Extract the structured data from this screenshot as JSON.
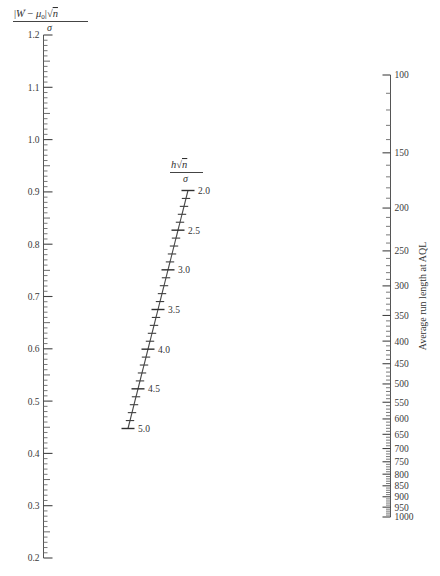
{
  "chart_data": {
    "type": "line",
    "title": "",
    "subtitle": "",
    "chart_kind": "nomogram",
    "left_axis": {
      "label_parts": {
        "numerator": "|W̅ − μ₀|√n",
        "numerator_w": "W",
        "numerator_mu": "μ",
        "numerator_mu_sub": "0",
        "numerator_sqrt": "n",
        "denominator": "σ"
      },
      "label_plain": "|W̅ − μ₀|√n / σ",
      "ticks": [
        "1.2",
        "1.1",
        "1.0",
        "0.9",
        "0.8",
        "0.7",
        "0.6",
        "0.5",
        "0.4",
        "0.3",
        "0.2"
      ],
      "values": [
        1.2,
        1.1,
        1.0,
        0.9,
        0.8,
        0.7,
        0.6,
        0.5,
        0.4,
        0.3,
        0.2
      ],
      "range": [
        0.2,
        1.2
      ],
      "minor_step": 0.01,
      "mid_step": 0.05,
      "major_step": 0.1,
      "scale": "linear",
      "orientation": "vertical-descending"
    },
    "middle_axis": {
      "label_parts": {
        "numerator_h": "h",
        "numerator_sqrt": "n",
        "denominator": "σ"
      },
      "label_plain": "h√n / σ",
      "ticks": [
        "2.0",
        "2.5",
        "3.0",
        "3.5",
        "4.0",
        "4.5",
        "5.0"
      ],
      "values": [
        2.0,
        2.5,
        3.0,
        3.5,
        4.0,
        4.5,
        5.0
      ],
      "range": [
        2.0,
        5.0
      ],
      "minor_step": 0.1,
      "major_step": 0.5,
      "scale": "linear",
      "orientation": "diagonal"
    },
    "right_axis": {
      "label": "Average run length at AQL",
      "ticks": [
        "100",
        "150",
        "200",
        "250",
        "300",
        "350",
        "400",
        "450",
        "500",
        "550",
        "600",
        "650",
        "700",
        "750",
        "800",
        "850",
        "900",
        "950",
        "1000"
      ],
      "values": [
        100,
        150,
        200,
        250,
        300,
        350,
        400,
        450,
        500,
        550,
        600,
        650,
        700,
        750,
        800,
        850,
        900,
        950,
        1000
      ],
      "range": [
        100,
        1000
      ],
      "scale": "logarithmic",
      "orientation": "vertical-descending"
    },
    "grid": false,
    "legend": "none",
    "background_color": "#ffffff",
    "line_color": "#4a4a4a",
    "text_color": "#333333"
  }
}
